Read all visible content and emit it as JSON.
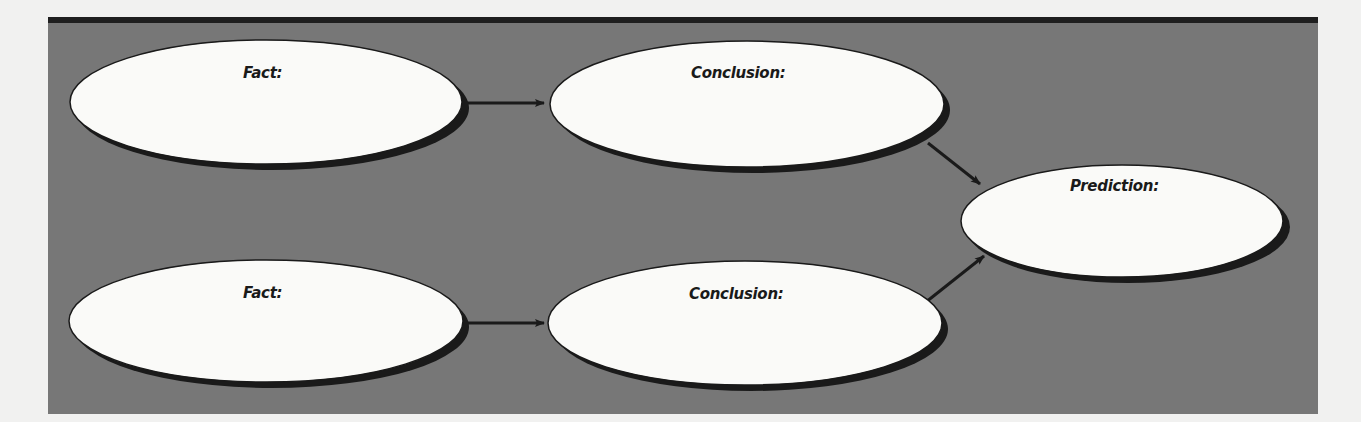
{
  "diagram": {
    "type": "flow",
    "background_color": "#f1f1f0",
    "panel_color": "#777777",
    "panel_border_color": "#1f1f1f",
    "node_fill": "#fafaf8",
    "node_stroke": "#1a1a1a",
    "shadow_color": "#1a1a1a",
    "nodes": [
      {
        "id": "fact1",
        "label": "Fact:"
      },
      {
        "id": "conclusion1",
        "label": "Conclusion:"
      },
      {
        "id": "fact2",
        "label": "Fact:"
      },
      {
        "id": "conclusion2",
        "label": "Conclusion:"
      },
      {
        "id": "prediction",
        "label": "Prediction:"
      }
    ],
    "edges": [
      {
        "from": "fact1",
        "to": "conclusion1"
      },
      {
        "from": "fact2",
        "to": "conclusion2"
      },
      {
        "from": "conclusion1",
        "to": "prediction"
      },
      {
        "from": "conclusion2",
        "to": "prediction"
      }
    ]
  }
}
